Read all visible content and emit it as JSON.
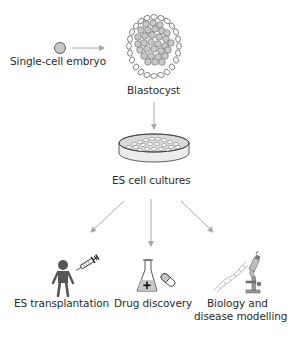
{
  "diagram": {
    "type": "flowchart",
    "colors": {
      "arrow": "#a8a8a8",
      "cell_fill": "#c8c8c8",
      "outline": "#3a3a3a",
      "text": "#2b2b2b"
    },
    "nodes": {
      "embryo": {
        "label": "Single-cell embryo",
        "icon": "single-cell-icon"
      },
      "blastocyst": {
        "label": "Blastocyst",
        "icon": "blastocyst-icon"
      },
      "cultures": {
        "label": "ES cell cultures",
        "icon": "petri-dish-icon"
      },
      "transplantation": {
        "label": "ES transplantation",
        "icon": "person-syringe-icon"
      },
      "drug": {
        "label": "Drug discovery",
        "icon": "flask-pill-icon"
      },
      "biology": {
        "label_line1": "Biology and",
        "label_line2": "disease modelling",
        "icon": "dna-microscope-icon"
      }
    },
    "edges": [
      {
        "from": "embryo",
        "to": "blastocyst"
      },
      {
        "from": "blastocyst",
        "to": "cultures"
      },
      {
        "from": "cultures",
        "to": "transplantation"
      },
      {
        "from": "cultures",
        "to": "drug"
      },
      {
        "from": "cultures",
        "to": "biology"
      }
    ]
  }
}
